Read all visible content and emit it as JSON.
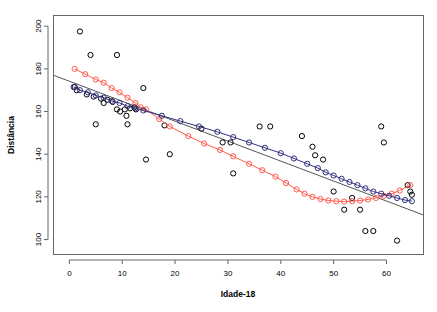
{
  "chart_data": {
    "type": "scatter",
    "title": "",
    "xlabel": "Idade-18",
    "ylabel": "Distância",
    "xlim": [
      -3,
      67
    ],
    "ylim": [
      93,
      205
    ],
    "xticks": [
      0,
      10,
      20,
      30,
      40,
      50,
      60
    ],
    "yticks": [
      100,
      120,
      140,
      160,
      180,
      200
    ],
    "grid": false,
    "legend": "none",
    "box": true,
    "colors": {
      "points": "#000000",
      "red_curve": "#FF5B4D",
      "blue_curve": "#31317F",
      "regression_line": "#555555",
      "axis": "#666666"
    },
    "series": [
      {
        "name": "observed-points",
        "type": "scatter",
        "marker": "open-circle",
        "color": "#000000",
        "points": [
          [
            2.0,
            197.5
          ],
          [
            4.0,
            186.5
          ],
          [
            9.0,
            186.5
          ],
          [
            1.0,
            171.5
          ],
          [
            1.4,
            170.0
          ],
          [
            3.3,
            168.0
          ],
          [
            4.6,
            167.0
          ],
          [
            6.0,
            166.0
          ],
          [
            6.5,
            164.0
          ],
          [
            7.2,
            165.5
          ],
          [
            8.2,
            164.5
          ],
          [
            14.0,
            171.0
          ],
          [
            9.0,
            161.0
          ],
          [
            9.6,
            160.0
          ],
          [
            10.5,
            161.0
          ],
          [
            10.8,
            158.0
          ],
          [
            11.5,
            161.5
          ],
          [
            12.3,
            162.0
          ],
          [
            12.6,
            161.0
          ],
          [
            5.0,
            154.0
          ],
          [
            11.0,
            154.0
          ],
          [
            14.5,
            137.5
          ],
          [
            19.0,
            140.0
          ],
          [
            18.0,
            153.5
          ],
          [
            25.0,
            152.0
          ],
          [
            29.0,
            145.5
          ],
          [
            31.0,
            131.0
          ],
          [
            36.0,
            153.0
          ],
          [
            44.0,
            148.5
          ],
          [
            46.0,
            143.5
          ],
          [
            46.5,
            139.5
          ],
          [
            48.0,
            137.5
          ],
          [
            50.0,
            122.5
          ],
          [
            52.0,
            114.0
          ],
          [
            53.5,
            119.5
          ],
          [
            55.0,
            114.0
          ],
          [
            56.0,
            104.0
          ],
          [
            57.5,
            104.0
          ],
          [
            59.0,
            153.0
          ],
          [
            59.5,
            145.5
          ],
          [
            62.0,
            99.5
          ],
          [
            64.0,
            125.5
          ],
          [
            64.5,
            122.5
          ],
          [
            64.8,
            121.0
          ],
          [
            38.0,
            153.0
          ],
          [
            30.5,
            145.5
          ]
        ]
      },
      {
        "name": "red-fitted-curve",
        "type": "line-with-markers",
        "marker": "open-circle",
        "color": "#FF5B4D",
        "points": [
          [
            1.0,
            180.0
          ],
          [
            3.0,
            177.5
          ],
          [
            5.0,
            175.0
          ],
          [
            6.5,
            173.5
          ],
          [
            8.0,
            171.0
          ],
          [
            9.5,
            169.0
          ],
          [
            11.0,
            166.5
          ],
          [
            12.5,
            164.0
          ],
          [
            13.5,
            162.0
          ],
          [
            14.5,
            161.0
          ],
          [
            17.0,
            156.5
          ],
          [
            19.0,
            153.0
          ],
          [
            22.5,
            148.5
          ],
          [
            25.5,
            145.0
          ],
          [
            28.5,
            142.0
          ],
          [
            31.0,
            139.0
          ],
          [
            34.0,
            135.5
          ],
          [
            36.5,
            132.5
          ],
          [
            39.0,
            129.5
          ],
          [
            41.0,
            126.5
          ],
          [
            43.0,
            123.5
          ],
          [
            44.5,
            121.5
          ],
          [
            46.0,
            120.0
          ],
          [
            47.5,
            119.0
          ],
          [
            49.0,
            118.3
          ],
          [
            50.5,
            118.0
          ],
          [
            52.0,
            117.8
          ],
          [
            53.5,
            118.0
          ],
          [
            55.0,
            118.3
          ],
          [
            56.5,
            118.8
          ],
          [
            58.0,
            119.5
          ],
          [
            59.5,
            120.5
          ],
          [
            61.0,
            121.5
          ],
          [
            62.5,
            123.0
          ],
          [
            64.5,
            125.5
          ]
        ]
      },
      {
        "name": "blue-fitted-curve",
        "type": "line-with-markers",
        "marker": "open-circle",
        "color": "#31317F",
        "points": [
          [
            0.8,
            171.5
          ],
          [
            2.0,
            170.0
          ],
          [
            3.5,
            169.0
          ],
          [
            5.0,
            167.5
          ],
          [
            6.5,
            166.5
          ],
          [
            8.0,
            165.0
          ],
          [
            9.5,
            164.0
          ],
          [
            11.0,
            162.5
          ],
          [
            12.5,
            161.5
          ],
          [
            14.0,
            160.5
          ],
          [
            17.5,
            158.0
          ],
          [
            21.0,
            155.5
          ],
          [
            24.5,
            153.0
          ],
          [
            28.0,
            150.5
          ],
          [
            31.0,
            148.0
          ],
          [
            34.0,
            145.5
          ],
          [
            37.0,
            143.0
          ],
          [
            40.0,
            140.5
          ],
          [
            42.5,
            138.0
          ],
          [
            45.0,
            135.5
          ],
          [
            47.0,
            133.5
          ],
          [
            48.5,
            131.5
          ],
          [
            50.0,
            130.0
          ],
          [
            51.5,
            128.5
          ],
          [
            53.0,
            127.0
          ],
          [
            54.5,
            125.5
          ],
          [
            56.0,
            124.0
          ],
          [
            57.5,
            122.5
          ],
          [
            59.0,
            121.5
          ],
          [
            60.5,
            120.5
          ],
          [
            62.0,
            119.5
          ],
          [
            63.5,
            118.5
          ],
          [
            64.8,
            118.0
          ]
        ]
      }
    ],
    "regression_line": {
      "name": "least-squares-line",
      "color": "#555555",
      "x_start": -3,
      "y_start": 177.0,
      "x_end": 67,
      "y_end": 111.5
    }
  }
}
